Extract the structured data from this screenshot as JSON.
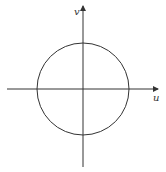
{
  "diagram": {
    "type": "circle-on-axes",
    "axes": {
      "horizontal_label": "u",
      "vertical_label": "v"
    },
    "circle": {
      "center": "origin"
    },
    "colors": {
      "stroke": "#333333",
      "background": "#ffffff"
    }
  }
}
